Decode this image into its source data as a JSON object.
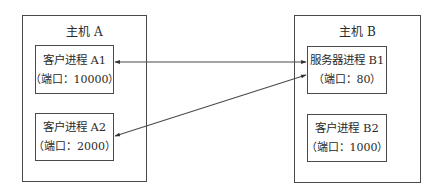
{
  "hosts": [
    {
      "title": "主机 A",
      "processes": [
        {
          "name": "客户进程 A1",
          "port": "（端口：10000）"
        },
        {
          "name": "客户进程 A2",
          "port": "（端口：2000）"
        }
      ]
    },
    {
      "title": "主机 B",
      "processes": [
        {
          "name": "服务器进程 B1",
          "port": "（端口：80）"
        },
        {
          "name": "客户进程 B2",
          "port": "（端口：1000）"
        }
      ]
    }
  ],
  "connections": [
    {
      "from": "客户进程 A1",
      "to": "服务器进程 B1",
      "direction": "bidirectional"
    },
    {
      "from": "客户进程 A2",
      "to": "服务器进程 B1",
      "direction": "bidirectional"
    }
  ],
  "colors": {
    "line": "#4a4a4a",
    "text": "#2a2a2a"
  }
}
